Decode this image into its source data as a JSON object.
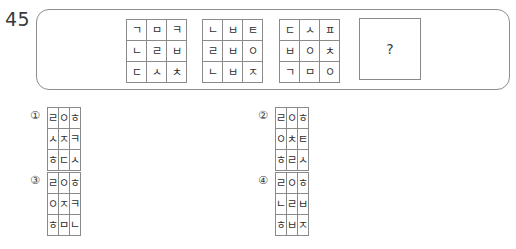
{
  "question": {
    "number": "45",
    "answer_placeholder": "?"
  },
  "stem": {
    "grids": [
      {
        "name": "stem-grid-1",
        "rows": [
          [
            "ㄱ",
            "ㅁ",
            "ㅋ"
          ],
          [
            "ㄴ",
            "ㄹ",
            "ㅂ"
          ],
          [
            "ㄷ",
            "ㅅ",
            "ㅊ"
          ]
        ]
      },
      {
        "name": "stem-grid-2",
        "rows": [
          [
            "ㄴ",
            "ㅂ",
            "ㅌ"
          ],
          [
            "ㄹ",
            "ㅂ",
            "ㅇ"
          ],
          [
            "ㄴ",
            "ㅂ",
            "ㅈ"
          ]
        ]
      },
      {
        "name": "stem-grid-3",
        "rows": [
          [
            "ㄷ",
            "ㅅ",
            "ㅍ"
          ],
          [
            "ㅂ",
            "ㅇ",
            "ㅊ"
          ],
          [
            "ㄱ",
            "ㅁ",
            "ㅇ"
          ]
        ]
      }
    ]
  },
  "options": [
    {
      "label": "①",
      "rows": [
        [
          "ㄹ",
          "ㅇ",
          "ㅎ"
        ],
        [
          "ㅅ",
          "ㅈ",
          "ㅋ"
        ],
        [
          "ㅎ",
          "ㄷ",
          "ㅅ"
        ]
      ]
    },
    {
      "label": "②",
      "rows": [
        [
          "ㄹ",
          "ㅇ",
          "ㅎ"
        ],
        [
          "ㅇ",
          "ㅊ",
          "ㅌ"
        ],
        [
          "ㅎ",
          "ㄹ",
          "ㅅ"
        ]
      ]
    },
    {
      "label": "③",
      "rows": [
        [
          "ㄹ",
          "ㅇ",
          "ㅎ"
        ],
        [
          "ㅇ",
          "ㅈ",
          "ㅋ"
        ],
        [
          "ㅎ",
          "ㅁ",
          "ㄴ"
        ]
      ]
    },
    {
      "label": "④",
      "rows": [
        [
          "ㄹ",
          "ㅇ",
          "ㅎ"
        ],
        [
          "ㄴ",
          "ㄹ",
          "ㅂ"
        ],
        [
          "ㅎ",
          "ㅂ",
          "ㅈ"
        ]
      ]
    }
  ]
}
